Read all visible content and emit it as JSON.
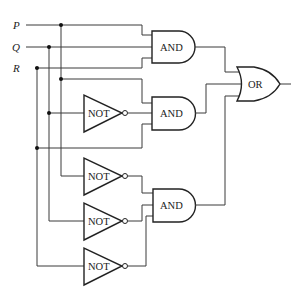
{
  "diagram": {
    "type": "logic-circuit",
    "inputs": [
      {
        "label": "P",
        "y": 25
      },
      {
        "label": "Q",
        "y": 47
      },
      {
        "label": "R",
        "y": 68
      }
    ],
    "gates": {
      "and1": {
        "label": "AND",
        "inputs": [
          "P",
          "Q",
          "R"
        ]
      },
      "and2": {
        "label": "AND",
        "inputs": [
          "P",
          "NOT Q",
          "R"
        ]
      },
      "and3": {
        "label": "AND",
        "inputs": [
          "NOT P",
          "NOT Q",
          "NOT R"
        ]
      },
      "not1": {
        "label": "NOT",
        "input": "Q"
      },
      "not2": {
        "label": "NOT",
        "input": "P"
      },
      "not3": {
        "label": "NOT",
        "input": "Q"
      },
      "not4": {
        "label": "NOT",
        "input": "R"
      },
      "or1": {
        "label": "OR",
        "inputs": [
          "AND1",
          "AND2",
          "AND3"
        ]
      }
    },
    "colors": {
      "line": "#3a3a3a",
      "background": "#ffffff"
    }
  }
}
